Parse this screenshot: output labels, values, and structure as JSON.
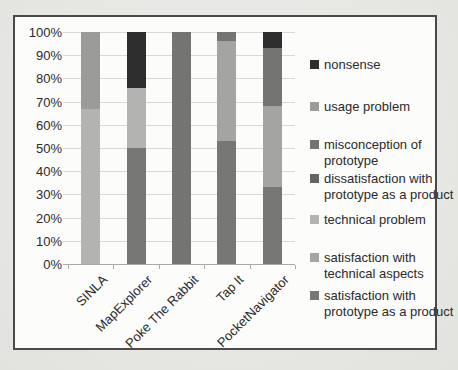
{
  "figure": {
    "background_page": "#e8e8e6",
    "background_chart": "#fcfcfb",
    "border_color": "#4a4a4a",
    "gridline_color": "#d8d8d6",
    "axis_color": "#a9a9a7",
    "text_color": "#2a2a2a"
  },
  "chart_data": {
    "type": "bar",
    "subtype": "stacked-100-percent-column",
    "title": "",
    "xlabel": "",
    "ylabel": "",
    "ylim": [
      0,
      100
    ],
    "grid": true,
    "legend_position": "right",
    "categories": [
      "SINLA",
      "MapExplorer",
      "Poke The Rabbit",
      "Tap It",
      "PocketNavigator"
    ],
    "y_tick_labels": [
      "0%",
      "10%",
      "20%",
      "30%",
      "40%",
      "50%",
      "60%",
      "70%",
      "80%",
      "90%",
      "100%"
    ],
    "series": [
      {
        "name": "satisfaction with prototype as a product",
        "color": "#777776",
        "values": [
          0,
          50,
          0,
          53,
          33
        ]
      },
      {
        "name": "satisfaction with technical aspects",
        "color": "#a4a4a2",
        "values": [
          0,
          0,
          0,
          43,
          35
        ]
      },
      {
        "name": "technical problem",
        "color": "#b3b3b1",
        "values": [
          67,
          26,
          0,
          0,
          0
        ]
      },
      {
        "name": "dissatisfaction with prototype as a product",
        "color": "#646463",
        "values": [
          0,
          0,
          0,
          0,
          0
        ]
      },
      {
        "name": "misconception of prototype",
        "color": "#747473",
        "values": [
          0,
          0,
          100,
          4,
          25
        ]
      },
      {
        "name": "usage problem",
        "color": "#9b9b99",
        "values": [
          33,
          0,
          0,
          0,
          0
        ]
      },
      {
        "name": "nonsense",
        "color": "#2e2e2e",
        "values": [
          0,
          24,
          0,
          0,
          7
        ]
      }
    ],
    "legend_entries": [
      {
        "series": "nonsense",
        "lines": [
          "nonsense"
        ]
      },
      {
        "series": "usage problem",
        "lines": [
          "usage problem"
        ]
      },
      {
        "series": "misconception of prototype",
        "lines": [
          "misconception of",
          "prototype"
        ]
      },
      {
        "series": "dissatisfaction with prototype as a product",
        "lines": [
          "dissatisfaction with",
          "prototype as a product"
        ]
      },
      {
        "series": "technical problem",
        "lines": [
          "technical problem"
        ]
      },
      {
        "series": "satisfaction with technical aspects",
        "lines": [
          "satisfaction with",
          "technical aspects"
        ]
      },
      {
        "series": "satisfaction with prototype as a product",
        "lines": [
          "satisfaction with",
          "prototype as a product"
        ]
      }
    ]
  }
}
